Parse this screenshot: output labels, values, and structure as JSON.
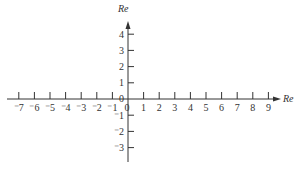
{
  "chart_data": {
    "type": "line",
    "title": "",
    "xlabel": "Re",
    "ylabel": "Re",
    "x_ticks": [
      -7,
      -6,
      -5,
      -4,
      -3,
      -2,
      -1,
      0,
      1,
      2,
      3,
      4,
      5,
      6,
      7,
      8,
      9
    ],
    "x_tick_labels": [
      "⁻7",
      "⁻6",
      "⁻5",
      "⁻4",
      "⁻3",
      "⁻2",
      "⁻1",
      "0",
      "1",
      "2",
      "3",
      "4",
      "5",
      "6",
      "7",
      "8",
      "9"
    ],
    "y_ticks": [
      4,
      3,
      2,
      1,
      0,
      -1,
      -2,
      -3
    ],
    "y_tick_labels": [
      "4",
      "3",
      "2",
      "1",
      "0",
      "⁻1",
      "⁻2",
      "⁻3"
    ],
    "xlim": [
      -7.8,
      9.5
    ],
    "ylim": [
      -4.2,
      4.8
    ],
    "grid": false,
    "legend": null,
    "series": []
  },
  "style": {
    "axis_color": "#333333",
    "background": "#ffffff"
  }
}
